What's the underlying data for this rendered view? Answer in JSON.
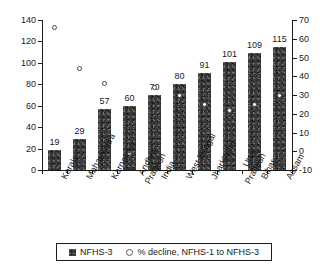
{
  "chart_data": {
    "type": "bar",
    "title": "",
    "subtitle": "",
    "xlabel": "",
    "ylabel": "",
    "y2label": "",
    "grid": false,
    "legend_position": "bottom",
    "categories": [
      "Kerala",
      "Maharashtra",
      "Karnataka",
      "Andhra Pradesh",
      "India",
      "West Bengal",
      "Jharkhand",
      "Uttar Pradesh",
      "Bihar",
      "Assam"
    ],
    "category_lines": [
      [
        "Kerala"
      ],
      [
        "Maharashtra"
      ],
      [
        "Karnataka"
      ],
      [
        "Andhra",
        "Pradesh"
      ],
      [
        "India"
      ],
      [
        "West Bengal"
      ],
      [
        "Jharkhand"
      ],
      [
        "Uttar",
        "Pradesh"
      ],
      [
        "Bihar"
      ],
      [
        "Assam"
      ]
    ],
    "series": [
      {
        "name": "NFHS-3",
        "axis": "left",
        "type": "bar",
        "values": [
          19,
          29,
          57,
          60,
          70,
          80,
          91,
          101,
          109,
          115
        ],
        "labels": [
          "19",
          "29",
          "57",
          "60",
          "70",
          "80",
          "91",
          "101",
          "109",
          "115"
        ]
      },
      {
        "name": "% decline, NFHS-1 to NFHS-3",
        "axis": "right",
        "type": "scatter",
        "values": [
          66,
          44,
          36,
          -1,
          34,
          30,
          25,
          22,
          25,
          30
        ]
      }
    ],
    "ylim": [
      0,
      140
    ],
    "yticks": [
      0,
      20,
      40,
      60,
      80,
      100,
      120,
      140
    ],
    "ytick_labels": [
      "0",
      "20",
      "40",
      "60",
      "80",
      "100",
      "120",
      "140"
    ],
    "y2lim": [
      -10,
      70
    ],
    "y2ticks": [
      -10,
      0,
      10,
      20,
      30,
      40,
      50,
      60,
      70
    ],
    "y2tick_labels": [
      "-10",
      "0",
      "10",
      "20",
      "30",
      "40",
      "50",
      "60",
      "70"
    ]
  },
  "legend": {
    "items": [
      {
        "label": "NFHS-3",
        "marker": "filled-square-icon"
      },
      {
        "label": "% decline, NFHS-1 to NFHS-3",
        "marker": "open-circle-icon"
      }
    ]
  }
}
